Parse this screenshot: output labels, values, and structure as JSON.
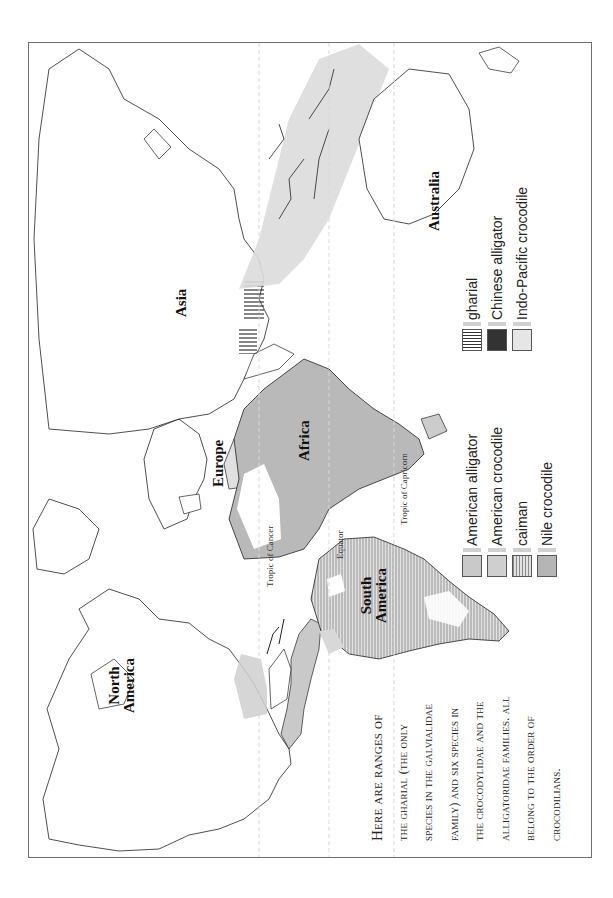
{
  "map": {
    "title": "Ranges of crocodilian species",
    "continents": {
      "north_america": [
        "North",
        "America"
      ],
      "south_america": [
        "South",
        "America"
      ],
      "europe": "Europe",
      "africa": "Africa",
      "asia": "Asia",
      "australia": "Australia"
    },
    "lines": {
      "tropic_of_cancer": "Tropic of Cancer",
      "equator": "Equator",
      "tropic_of_capricorn": "Tropic of Capricorn"
    },
    "caption": {
      "lines": [
        "Here are ranges of",
        "the gharial (the only",
        "species in the Galvialidae",
        "family) and six species in",
        "the Crocodylidae and the",
        "Alligatoridae families. All",
        "belong to the order of",
        "crocodilians."
      ]
    },
    "legend_left": [
      {
        "label": "American alligator",
        "pattern": "solid",
        "color": "#c9c9c9"
      },
      {
        "label": "American crocodile",
        "pattern": "solid",
        "color": "#cfcfcf"
      },
      {
        "label": "caiman",
        "pattern": "horizontal-stripes",
        "color": "#bdbdbd"
      },
      {
        "label": "Nile crocodile",
        "pattern": "solid",
        "color": "#b5b5b5"
      }
    ],
    "legend_right": [
      {
        "label": "gharial",
        "pattern": "vertical-stripes",
        "color": "#555555"
      },
      {
        "label": "Chinese alligator",
        "pattern": "solid",
        "color": "#333333"
      },
      {
        "label": "Indo-Pacific crocodile",
        "pattern": "solid",
        "color": "#e6e6e6"
      }
    ],
    "colors": {
      "border": "#6e6e6e",
      "coast": "#1a1a1a",
      "range_light": "#dcdcdc",
      "range_mid": "#bcbcbc",
      "range_dark": "#333333"
    }
  }
}
